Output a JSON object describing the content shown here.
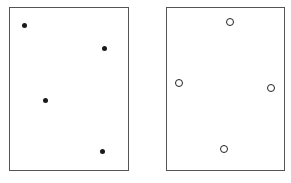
{
  "panels": [
    {
      "name": "left-panel",
      "marker": "filled-dot",
      "box": {
        "x": 9,
        "y": 7,
        "w": 120,
        "h": 164
      },
      "points": [
        {
          "x": 24,
          "y": 25
        },
        {
          "x": 104,
          "y": 48
        },
        {
          "x": 45,
          "y": 100
        },
        {
          "x": 102,
          "y": 151
        }
      ]
    },
    {
      "name": "right-panel",
      "marker": "hollow-circle",
      "box": {
        "x": 166,
        "y": 7,
        "w": 119,
        "h": 164
      },
      "points": [
        {
          "x": 230,
          "y": 22
        },
        {
          "x": 179,
          "y": 83
        },
        {
          "x": 271,
          "y": 88
        },
        {
          "x": 224,
          "y": 149
        }
      ]
    }
  ],
  "colors": {
    "border": "#555555",
    "marker": "#1a1a1a",
    "background": "#ffffff"
  }
}
